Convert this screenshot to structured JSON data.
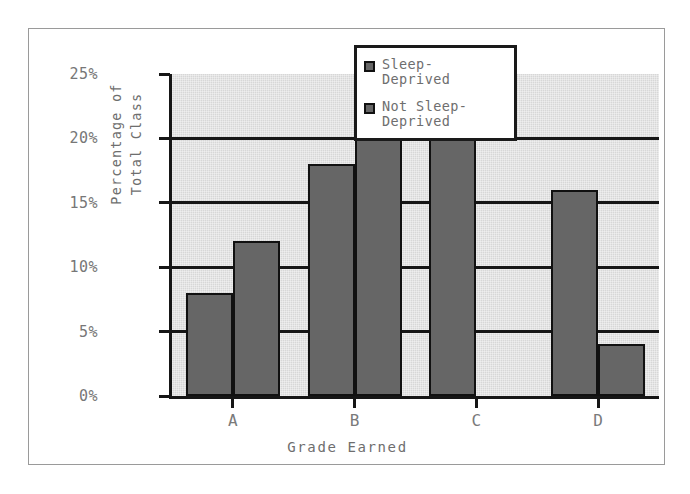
{
  "chart_data": {
    "type": "bar",
    "title": "",
    "categories": [
      "A",
      "B",
      "C",
      "D"
    ],
    "series": [
      {
        "name": "Sleep-\nDeprived",
        "values": [
          8,
          18,
          20,
          16
        ],
        "color": "#666666"
      },
      {
        "name": "Not Sleep-\nDeprived",
        "values": [
          12,
          22,
          0,
          4
        ],
        "color": "#666666"
      }
    ],
    "xlabel": "Grade Earned",
    "ylabel_lines": [
      "Percentage of",
      "Total Class"
    ],
    "ylim": [
      0,
      25
    ],
    "ytick_labels": [
      "0%",
      "5%",
      "10%",
      "15%",
      "20%",
      "25%"
    ],
    "ytick_values": [
      0,
      5,
      10,
      15,
      20,
      25
    ],
    "grid": true,
    "legend_position": "top-right",
    "plot_background": "#d7d7d7",
    "frame_color": "#9a9a9a",
    "axis_color": "#161616"
  }
}
